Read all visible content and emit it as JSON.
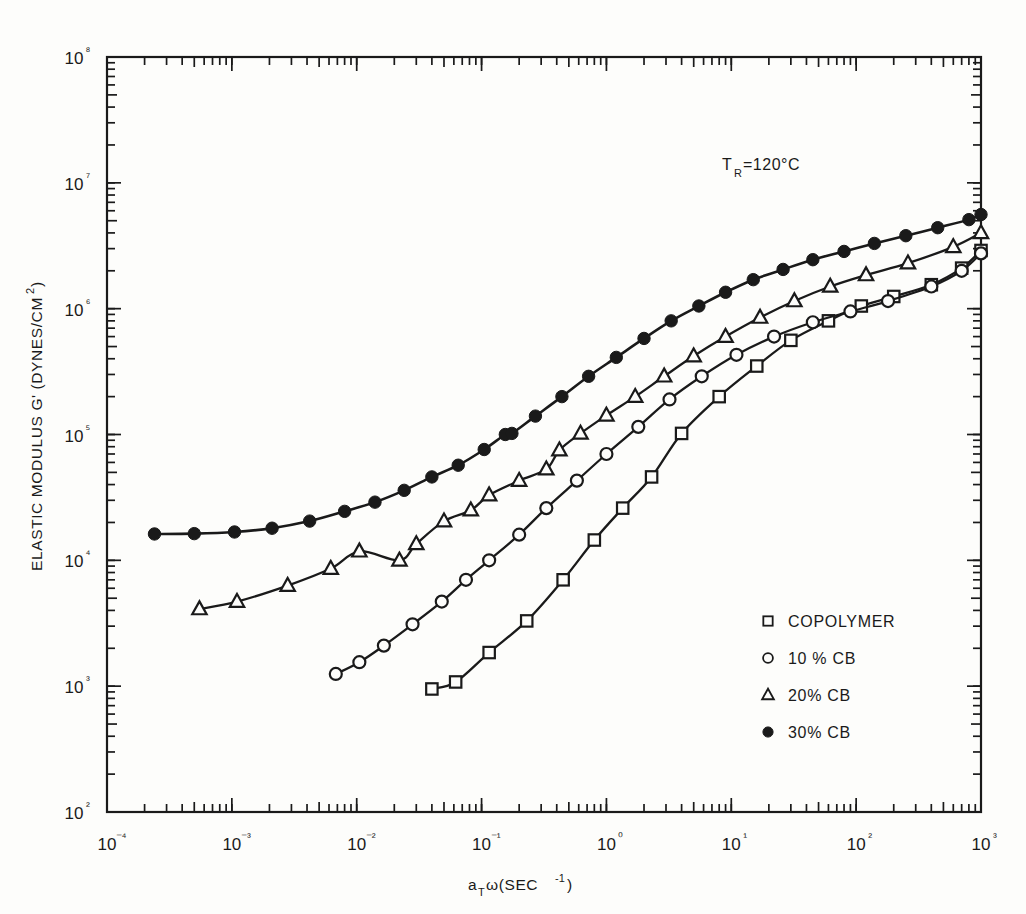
{
  "figure": {
    "background": "#fdfdfb",
    "ink_color": "#1a1a1a"
  },
  "annotation": {
    "symbol": "T",
    "subscript": "R",
    "value": " =120°C",
    "full_text": "T_R =120°C"
  },
  "legend": {
    "entries": [
      {
        "marker": "open-square",
        "label": "COPOLYMER"
      },
      {
        "marker": "open-circle",
        "label": "10 % CB"
      },
      {
        "marker": "open-triangle",
        "label": "20% CB"
      },
      {
        "marker": "filled-circle",
        "label": "30% CB"
      }
    ]
  },
  "chart_data": {
    "type": "line",
    "title": "",
    "subtitle": "",
    "annotations": [
      "T_R =120°C"
    ],
    "xlabel": "a_T ω(SEC⁻¹)",
    "ylabel": "ELASTIC MODULUS G' (DYNES/CM²)",
    "xscale": "log",
    "yscale": "log",
    "xlim": [
      0.0001,
      1000
    ],
    "ylim": [
      100,
      100000000
    ],
    "grid": false,
    "legend_position": "lower-right-inside",
    "x_tick_labels": [
      "10⁻⁴",
      "10⁻³",
      "10⁻²",
      "10⁻¹",
      "10⁰",
      "10¹",
      "10²",
      "10³"
    ],
    "x_tick_values": [
      0.0001,
      0.001,
      0.01,
      0.1,
      1,
      10,
      100,
      1000
    ],
    "y_tick_labels": [
      "10²",
      "10³",
      "10⁴",
      "10⁵",
      "10⁶",
      "10⁷",
      "10⁸"
    ],
    "y_tick_values": [
      100,
      1000,
      10000,
      100000,
      1000000,
      10000000,
      100000000
    ],
    "minor_ticks": true,
    "series": [
      {
        "name": "COPOLYMER",
        "marker": "open-square",
        "points": [
          [
            0.04,
            950.0
          ],
          [
            0.062,
            1080.0
          ],
          [
            0.115,
            1850.0
          ],
          [
            0.23,
            3300.0
          ],
          [
            0.45,
            7000.0
          ],
          [
            0.8,
            14500.0
          ],
          [
            1.35,
            26000.0
          ],
          [
            2.3,
            46000.0
          ],
          [
            4.0,
            102000.0
          ],
          [
            8.0,
            200000.0
          ],
          [
            16,
            350000.0
          ],
          [
            30,
            560000.0
          ],
          [
            60,
            800000.0
          ],
          [
            110,
            1050000.0
          ],
          [
            200,
            1250000.0
          ],
          [
            400,
            1550000.0
          ],
          [
            700,
            2100000.0
          ],
          [
            1000,
            2900000.0
          ]
        ]
      },
      {
        "name": "10 % CB",
        "marker": "open-circle",
        "points": [
          [
            0.0068,
            1250.0
          ],
          [
            0.0105,
            1550.0
          ],
          [
            0.0165,
            2100.0
          ],
          [
            0.028,
            3100.0
          ],
          [
            0.048,
            4700.0
          ],
          [
            0.075,
            7000.0
          ],
          [
            0.115,
            10000.0
          ],
          [
            0.2,
            16000.0
          ],
          [
            0.33,
            26000.0
          ],
          [
            0.58,
            43000.0
          ],
          [
            1.0,
            70000.0
          ],
          [
            1.8,
            115000.0
          ],
          [
            3.2,
            190000.0
          ],
          [
            5.8,
            290000.0
          ],
          [
            11,
            430000.0
          ],
          [
            22,
            600000.0
          ],
          [
            45,
            780000.0
          ],
          [
            90,
            950000.0
          ],
          [
            180,
            1150000.0
          ],
          [
            400,
            1500000.0
          ],
          [
            700,
            2000000.0
          ],
          [
            1000,
            2750000.0
          ]
        ]
      },
      {
        "name": "20% CB",
        "marker": "open-triangle",
        "points": [
          [
            0.00055,
            4100.0
          ],
          [
            0.0011,
            4700.0
          ],
          [
            0.0028,
            6300.0
          ],
          [
            0.0062,
            8600.0
          ],
          [
            0.0105,
            11800.0
          ],
          [
            0.022,
            10000.0
          ],
          [
            0.03,
            13500.0
          ],
          [
            0.05,
            20500.0
          ],
          [
            0.082,
            25000.0
          ],
          [
            0.115,
            33000.0
          ],
          [
            0.2,
            43000.0
          ],
          [
            0.33,
            53000.0
          ],
          [
            0.42,
            75000.0
          ],
          [
            0.62,
            102000.0
          ],
          [
            1.0,
            142000.0
          ],
          [
            1.7,
            200000.0
          ],
          [
            2.9,
            290000.0
          ],
          [
            5.0,
            420000.0
          ],
          [
            9.0,
            600000.0
          ],
          [
            17,
            850000.0
          ],
          [
            32,
            1150000.0
          ],
          [
            62,
            1500000.0
          ],
          [
            120,
            1850000.0
          ],
          [
            260,
            2300000.0
          ],
          [
            600,
            3100000.0
          ],
          [
            1000,
            4000000.0
          ]
        ]
      },
      {
        "name": "30% CB",
        "marker": "filled-circle",
        "points": [
          [
            0.00024,
            16200.0
          ],
          [
            0.0005,
            16300.0
          ],
          [
            0.00105,
            16800.0
          ],
          [
            0.0021,
            18000.0
          ],
          [
            0.0042,
            20500.0
          ],
          [
            0.008,
            24500.0
          ],
          [
            0.014,
            29000.0
          ],
          [
            0.024,
            36000.0
          ],
          [
            0.04,
            46000.0
          ],
          [
            0.065,
            57000.0
          ],
          [
            0.105,
            76000.0
          ],
          [
            0.155,
            100000.0
          ],
          [
            0.175,
            102000.0
          ],
          [
            0.27,
            140000.0
          ],
          [
            0.44,
            200000.0
          ],
          [
            0.72,
            290000.0
          ],
          [
            1.2,
            410000.0
          ],
          [
            2.0,
            580000.0
          ],
          [
            3.3,
            800000.0
          ],
          [
            5.5,
            1050000.0
          ],
          [
            9.0,
            1350000.0
          ],
          [
            15,
            1700000.0
          ],
          [
            26,
            2050000.0
          ],
          [
            45,
            2450000.0
          ],
          [
            80,
            2850000.0
          ],
          [
            140,
            3300000.0
          ],
          [
            250,
            3800000.0
          ],
          [
            450,
            4400000.0
          ],
          [
            800,
            5100000.0
          ],
          [
            1000,
            5600000.0
          ]
        ]
      }
    ]
  }
}
